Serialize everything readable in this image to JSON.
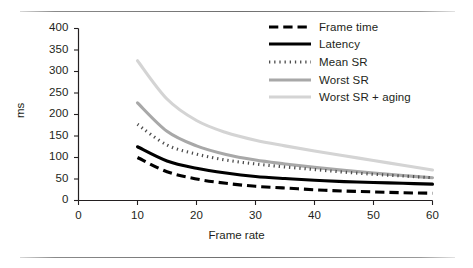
{
  "chart_data": {
    "type": "line",
    "title": "",
    "subtitle": "",
    "xlabel": "Frame rate",
    "ylabel": "ms",
    "xlim": [
      0,
      60
    ],
    "ylim": [
      0,
      400
    ],
    "xticks": [
      "0",
      "10",
      "20",
      "30",
      "40",
      "50",
      "60"
    ],
    "yticks": [
      "0",
      "50",
      "100",
      "150",
      "200",
      "250",
      "300",
      "350",
      "400"
    ],
    "grid": false,
    "legend_position": "top-right",
    "x": [
      10,
      15,
      20,
      25,
      30,
      35,
      40,
      45,
      50,
      55,
      60
    ],
    "series": [
      {
        "name": "Frame time",
        "style": "dashed",
        "color": "#000000",
        "width": 3.1,
        "values": [
          100,
          67,
          50,
          40,
          33,
          29,
          25,
          22,
          20,
          18,
          17
        ]
      },
      {
        "name": "Latency",
        "style": "solid",
        "color": "#000000",
        "width": 3.1,
        "values": [
          125,
          92,
          75,
          64,
          56,
          51,
          47,
          44,
          42,
          40,
          38
        ]
      },
      {
        "name": "Mean SR",
        "style": "dotted",
        "color": "#4d4d4d",
        "width": 3.1,
        "values": [
          177,
          129,
          108,
          94,
          85,
          78,
          72,
          66,
          61,
          57,
          53
        ]
      },
      {
        "name": "Worst SR",
        "style": "solid",
        "color": "#a8a8a8",
        "width": 3.1,
        "values": [
          227,
          161,
          127,
          107,
          94,
          85,
          77,
          70,
          64,
          58,
          53
        ]
      },
      {
        "name": "Worst SR + aging",
        "style": "solid",
        "color": "#d4d4d4",
        "width": 3.1,
        "values": [
          325,
          236,
          186,
          158,
          140,
          127,
          115,
          104,
          93,
          82,
          71
        ]
      }
    ]
  },
  "axes": {
    "y_axis_title": "ms",
    "x_axis_title": "Frame rate"
  },
  "legend": {
    "items": [
      {
        "label": "Frame time"
      },
      {
        "label": "Latency"
      },
      {
        "label": "Mean SR"
      },
      {
        "label": "Worst SR"
      },
      {
        "label": "Worst SR + aging"
      }
    ]
  },
  "colors": {
    "axis": "#231f20",
    "text": "#231f20",
    "rule": "#6f6f6f",
    "frame_time": "#000000",
    "latency": "#000000",
    "mean_sr": "#4d4d4d",
    "worst_sr": "#a8a8a8",
    "worst_sr_aging": "#d4d4d4"
  }
}
